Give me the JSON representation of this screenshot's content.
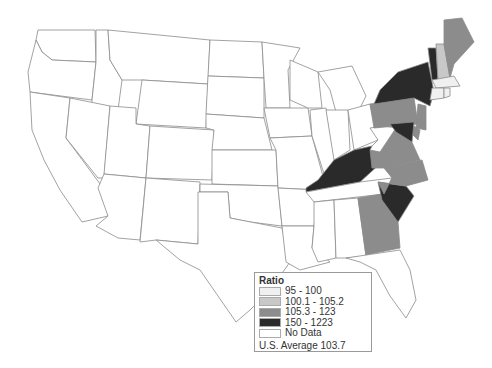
{
  "map": {
    "type": "choropleth",
    "region": "United States",
    "colors": {
      "bin1": "#f0f0f0",
      "bin2": "#c8c8c8",
      "bin3": "#8c8c8c",
      "bin4": "#2a2a2a",
      "nodata": "#ffffff"
    },
    "states": [
      {
        "id": "WA",
        "bin": "nodata"
      },
      {
        "id": "OR",
        "bin": "nodata"
      },
      {
        "id": "CA",
        "bin": "nodata"
      },
      {
        "id": "ID",
        "bin": "nodata"
      },
      {
        "id": "NV",
        "bin": "nodata"
      },
      {
        "id": "MT",
        "bin": "nodata"
      },
      {
        "id": "WY",
        "bin": "nodata"
      },
      {
        "id": "UT",
        "bin": "nodata"
      },
      {
        "id": "AZ",
        "bin": "nodata"
      },
      {
        "id": "CO",
        "bin": "nodata"
      },
      {
        "id": "NM",
        "bin": "nodata"
      },
      {
        "id": "ND",
        "bin": "nodata"
      },
      {
        "id": "SD",
        "bin": "nodata"
      },
      {
        "id": "NE",
        "bin": "nodata"
      },
      {
        "id": "KS",
        "bin": "nodata"
      },
      {
        "id": "OK",
        "bin": "nodata"
      },
      {
        "id": "TX",
        "bin": "nodata"
      },
      {
        "id": "MN",
        "bin": "nodata"
      },
      {
        "id": "IA",
        "bin": "nodata"
      },
      {
        "id": "MO",
        "bin": "nodata"
      },
      {
        "id": "AR",
        "bin": "nodata"
      },
      {
        "id": "LA",
        "bin": "nodata"
      },
      {
        "id": "WI",
        "bin": "nodata"
      },
      {
        "id": "IL",
        "bin": "nodata"
      },
      {
        "id": "MI",
        "bin": "nodata"
      },
      {
        "id": "IN",
        "bin": "nodata"
      },
      {
        "id": "OH",
        "bin": "nodata"
      },
      {
        "id": "KY",
        "bin": "bin4"
      },
      {
        "id": "TN",
        "bin": "nodata"
      },
      {
        "id": "MS",
        "bin": "nodata"
      },
      {
        "id": "AL",
        "bin": "nodata"
      },
      {
        "id": "GA",
        "bin": "bin3"
      },
      {
        "id": "FL",
        "bin": "nodata"
      },
      {
        "id": "SC",
        "bin": "bin4"
      },
      {
        "id": "NC",
        "bin": "bin3"
      },
      {
        "id": "VA",
        "bin": "bin3"
      },
      {
        "id": "WV",
        "bin": "nodata"
      },
      {
        "id": "PA",
        "bin": "bin3"
      },
      {
        "id": "NY",
        "bin": "bin4"
      },
      {
        "id": "VT",
        "bin": "bin4"
      },
      {
        "id": "NH",
        "bin": "bin2"
      },
      {
        "id": "ME",
        "bin": "bin3"
      },
      {
        "id": "MA",
        "bin": "bin1"
      },
      {
        "id": "CT",
        "bin": "bin1"
      },
      {
        "id": "RI",
        "bin": "bin1"
      },
      {
        "id": "NJ",
        "bin": "bin3"
      },
      {
        "id": "DE",
        "bin": "bin3"
      },
      {
        "id": "MD",
        "bin": "bin4"
      }
    ]
  },
  "legend": {
    "title": "Ratio",
    "items": [
      {
        "label": "95 - 100",
        "bin": "bin1"
      },
      {
        "label": "100.1 - 105.2",
        "bin": "bin2"
      },
      {
        "label": "105.3 - 123",
        "bin": "bin3"
      },
      {
        "label": "150 - 1223",
        "bin": "bin4"
      },
      {
        "label": "No Data",
        "bin": "nodata"
      }
    ],
    "footnote": "U.S. Average 103.7"
  }
}
